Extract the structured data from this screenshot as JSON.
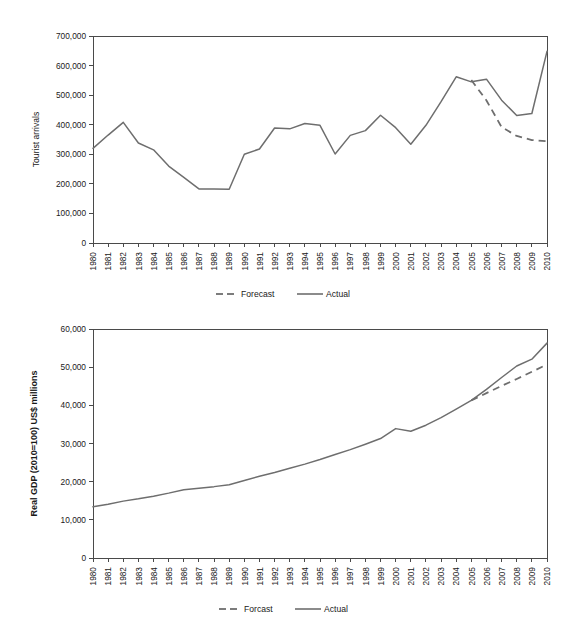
{
  "chart_data": [
    {
      "id": "tourist-arrivals",
      "type": "line",
      "title": "",
      "xlabel": "",
      "ylabel": "Tourist arrivals",
      "ylim": [
        0,
        700000
      ],
      "yticks": [
        0,
        100000,
        200000,
        300000,
        400000,
        500000,
        600000,
        700000
      ],
      "ytick_labels": [
        "0",
        "100,000",
        "200,000",
        "300,000",
        "400,000",
        "500,000",
        "600,000",
        "700,000"
      ],
      "grid": false,
      "legend_position": "bottom",
      "x": [
        1980,
        1981,
        1982,
        1983,
        1984,
        1985,
        1986,
        1987,
        1988,
        1989,
        1990,
        1991,
        1992,
        1993,
        1994,
        1995,
        1996,
        1997,
        1998,
        1999,
        2000,
        2001,
        2002,
        2003,
        2004,
        2005,
        2006,
        2007,
        2008,
        2009,
        2010
      ],
      "xtick_labels": [
        "1980",
        "1981",
        "1982",
        "1983",
        "1984",
        "1985",
        "1986",
        "1987",
        "1988",
        "1989",
        "1990",
        "1991",
        "1992",
        "1993",
        "1994",
        "1995",
        "1996",
        "1997",
        "1998",
        "1999",
        "2000",
        "2001",
        "2002",
        "2003",
        "2004",
        "2005",
        "2006",
        "2007",
        "2008",
        "2009",
        "2010"
      ],
      "series": [
        {
          "name": "Actual",
          "style": "solid",
          "color": "#6e6e6e",
          "x": [
            1980,
            1981,
            1982,
            1983,
            1984,
            1985,
            1986,
            1987,
            1988,
            1989,
            1990,
            1991,
            1992,
            1993,
            1994,
            1995,
            1996,
            1997,
            1998,
            1999,
            2000,
            2001,
            2002,
            2003,
            2004,
            2005,
            2006,
            2007,
            2008,
            2009,
            2010
          ],
          "values": [
            320000,
            365000,
            408000,
            338000,
            315000,
            260000,
            222000,
            183000,
            183000,
            182000,
            300000,
            318000,
            389000,
            386000,
            404000,
            398000,
            301000,
            364000,
            380000,
            432000,
            390000,
            334000,
            398000,
            478000,
            562000,
            545000,
            554000,
            483000,
            431000,
            438000,
            648000
          ]
        },
        {
          "name": "Forecast",
          "style": "dashed",
          "color": "#6e6e6e",
          "x": [
            2005,
            2006,
            2007,
            2008,
            2009,
            2010
          ],
          "values": [
            551000,
            482000,
            392000,
            362000,
            348000,
            344000
          ]
        }
      ],
      "legend": [
        {
          "label": "Forecast",
          "style": "dashed",
          "color": "#6e6e6e"
        },
        {
          "label": "Actual",
          "style": "solid",
          "color": "#6e6e6e"
        }
      ]
    },
    {
      "id": "real-gdp",
      "type": "line",
      "title": "",
      "xlabel": "",
      "ylabel": "Real GDP (2010=100) US$ millions",
      "ylim": [
        0,
        60000
      ],
      "yticks": [
        0,
        10000,
        20000,
        30000,
        40000,
        50000,
        60000
      ],
      "ytick_labels": [
        "0",
        "10,000",
        "20,000",
        "30,000",
        "40,000",
        "50,000",
        "60,000"
      ],
      "grid": false,
      "legend_position": "bottom",
      "x": [
        1980,
        1981,
        1982,
        1983,
        1984,
        1985,
        1986,
        1987,
        1988,
        1989,
        1990,
        1991,
        1992,
        1993,
        1994,
        1995,
        1996,
        1997,
        1998,
        1999,
        2000,
        2001,
        2002,
        2003,
        2004,
        2005,
        2006,
        2007,
        2008,
        2009,
        2010
      ],
      "xtick_labels": [
        "1980",
        "1981",
        "1982",
        "1983",
        "1984",
        "1985",
        "1986",
        "1987",
        "1988",
        "1989",
        "1990",
        "1991",
        "1992",
        "1993",
        "1994",
        "1995",
        "1996",
        "1997",
        "1998",
        "1999",
        "2000",
        "2001",
        "2002",
        "2003",
        "2004",
        "2005",
        "2006",
        "2007",
        "2008",
        "2009",
        "2010"
      ],
      "series": [
        {
          "name": "Actual",
          "style": "solid",
          "color": "#6e6e6e",
          "x": [
            1980,
            1981,
            1982,
            1983,
            1984,
            1985,
            1986,
            1987,
            1988,
            1989,
            1990,
            1991,
            1992,
            1993,
            1994,
            1995,
            1996,
            1997,
            1998,
            1999,
            2000,
            2001,
            2002,
            2003,
            2004,
            2005,
            2006,
            2007,
            2008,
            2009,
            2010
          ],
          "values": [
            13400,
            14100,
            14900,
            15500,
            16200,
            17000,
            17900,
            18300,
            18700,
            19200,
            20300,
            21400,
            22400,
            23500,
            24600,
            25800,
            27100,
            28400,
            29800,
            31300,
            33900,
            33200,
            34800,
            36800,
            39000,
            41300,
            44200,
            47300,
            50300,
            52100,
            56300
          ]
        },
        {
          "name": "Forcast",
          "style": "dashed",
          "color": "#6e6e6e",
          "x": [
            2005,
            2006,
            2007,
            2008,
            2009,
            2010
          ],
          "values": [
            41300,
            43200,
            45100,
            46900,
            48800,
            50700
          ]
        }
      ],
      "legend": [
        {
          "label": "Forcast",
          "style": "dashed",
          "color": "#6e6e6e"
        },
        {
          "label": "Actual",
          "style": "solid",
          "color": "#6e6e6e"
        }
      ]
    }
  ]
}
